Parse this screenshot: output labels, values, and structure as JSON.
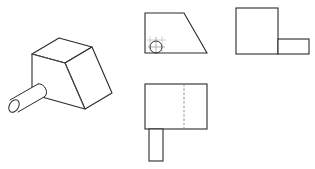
{
  "figure": {
    "stroke_color": "#2a2a2a",
    "thin_color": "#555555",
    "background": "#ffffff",
    "views": [
      {
        "id": "isometric",
        "label": "Isometric view (block with cylindrical shaft)"
      },
      {
        "id": "front",
        "label": "Front view (trapezoid with circle and center marks)"
      },
      {
        "id": "side",
        "label": "Side view (square with rectangular shaft)"
      },
      {
        "id": "top",
        "label": "Top view (rectangle with hidden line and shaft)"
      }
    ]
  }
}
